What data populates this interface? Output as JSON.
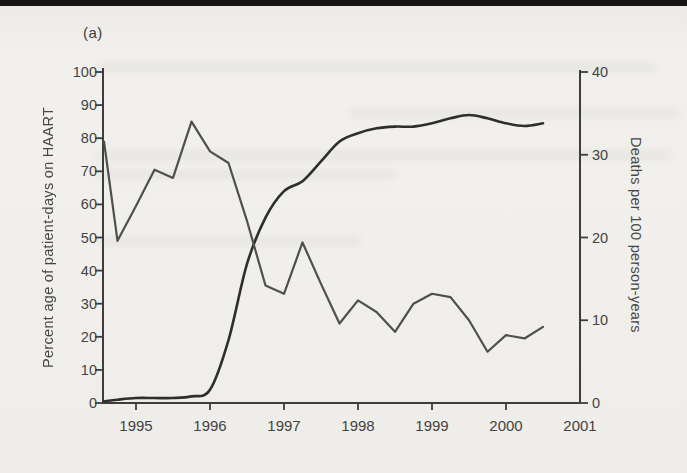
{
  "figure": {
    "panel_label": "(a)"
  },
  "colors": {
    "background": "#f0efeb",
    "scan_strip": "#161616",
    "axis": "#3d3d3d",
    "text": "#454545",
    "haart_line": "#2e2e2e",
    "deaths_line": "#4f4f4f"
  },
  "chart_data": {
    "type": "line",
    "title": "",
    "grid": false,
    "legend": "none",
    "x": [
      1994.5,
      1994.75,
      1995.0,
      1995.25,
      1995.5,
      1995.75,
      1996.0,
      1996.25,
      1996.5,
      1996.75,
      1997.0,
      1997.25,
      1997.5,
      1997.75,
      1998.0,
      1998.25,
      1998.5,
      1998.75,
      1999.0,
      1999.25,
      1999.5,
      1999.75,
      2000.0,
      2000.25,
      2000.5
    ],
    "series": [
      {
        "name": "Percent of patient-days on HAART",
        "axis": "left",
        "style": "smooth",
        "values": [
          0.5,
          1.0,
          1.5,
          1.5,
          1.5,
          2.0,
          4.0,
          19.0,
          42.0,
          56.0,
          64.0,
          67.0,
          73.0,
          79.0,
          81.5,
          83.0,
          83.5,
          83.5,
          84.5,
          86.0,
          87.0,
          86.0,
          84.5,
          83.7,
          84.5
        ]
      },
      {
        "name": "Deaths per 100 person-years",
        "axis": "right",
        "style": "angular",
        "values": [
          31.6,
          19.6,
          23.8,
          28.2,
          27.2,
          34.0,
          30.4,
          29.0,
          22.0,
          14.2,
          13.2,
          19.4,
          14.4,
          9.6,
          12.4,
          11.0,
          8.6,
          12.0,
          13.2,
          12.8,
          10.0,
          6.2,
          8.2,
          7.8,
          9.2
        ]
      }
    ],
    "left_axis": {
      "label": "Percent age of patient-days on HAART",
      "min": 0,
      "max": 100,
      "ticks": [
        0,
        10,
        20,
        30,
        40,
        50,
        60,
        70,
        80,
        90,
        100
      ]
    },
    "right_axis": {
      "label": "Deaths per 100 person-years",
      "min": 0,
      "max": 40,
      "ticks": [
        0,
        10,
        20,
        30,
        40
      ]
    },
    "x_axis": {
      "label": "",
      "tick_years": [
        1995,
        1996,
        1997,
        1998,
        1999,
        2000
      ],
      "label_years": [
        1995,
        1996,
        1997,
        1998,
        1999,
        2000,
        2001
      ],
      "labels": [
        "1995",
        "1996",
        "1997",
        "1998",
        "1999",
        "2000",
        "2001"
      ],
      "range": [
        1994.5,
        2001
      ]
    }
  }
}
